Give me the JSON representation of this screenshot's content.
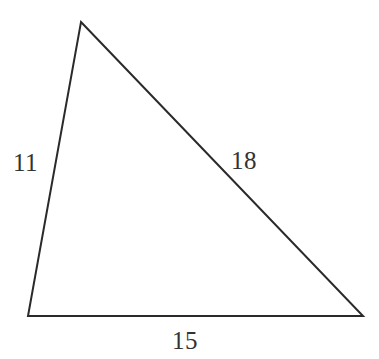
{
  "figure": {
    "name": "triangle-with-side-lengths",
    "background_color": "#ffffff",
    "stroke_color": "#2a2a2a",
    "stroke_width": 2,
    "label_color": "#333333",
    "shape": "triangle",
    "vertices": {
      "apex": {
        "x": 81,
        "y": 22
      },
      "bottom_left": {
        "x": 28,
        "y": 316
      },
      "bottom_right": {
        "x": 363,
        "y": 316
      }
    },
    "labels": {
      "left_side": "11",
      "right_side": "18",
      "bottom_side": "15"
    }
  }
}
